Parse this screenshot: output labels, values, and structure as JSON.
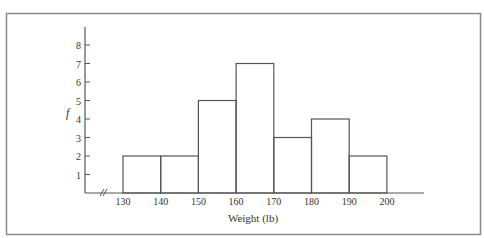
{
  "chart_data": {
    "type": "bar",
    "subtype": "histogram",
    "title": "",
    "xlabel": "Weight (lb)",
    "ylabel": "f",
    "bins": [
      {
        "from": 130,
        "to": 140,
        "value": 2
      },
      {
        "from": 140,
        "to": 150,
        "value": 2
      },
      {
        "from": 150,
        "to": 160,
        "value": 5
      },
      {
        "from": 160,
        "to": 170,
        "value": 7
      },
      {
        "from": 170,
        "to": 180,
        "value": 3
      },
      {
        "from": 180,
        "to": 190,
        "value": 4
      },
      {
        "from": 190,
        "to": 200,
        "value": 2
      }
    ],
    "categories": [
      "130-140",
      "140-150",
      "150-160",
      "160-170",
      "170-180",
      "180-190",
      "190-200"
    ],
    "values": [
      2,
      2,
      5,
      7,
      3,
      4,
      2
    ],
    "x_ticks": [
      "130",
      "140",
      "150",
      "160",
      "170",
      "180",
      "190",
      "200"
    ],
    "y_ticks": [
      "1",
      "2",
      "3",
      "4",
      "5",
      "6",
      "7",
      "8"
    ],
    "ylim": [
      0,
      8
    ],
    "xlim": [
      130,
      200
    ],
    "axis_break": true,
    "grid": false,
    "legend": null
  },
  "colors": {
    "line": "#555555",
    "frame": "#8a8a8a",
    "text": "#333333"
  }
}
